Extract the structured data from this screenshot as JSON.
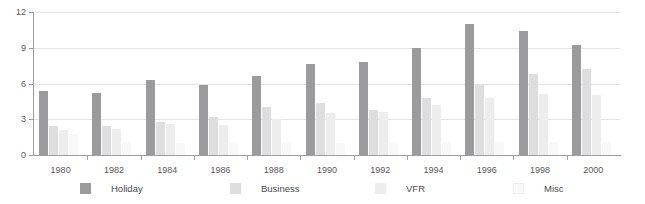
{
  "chart_data": {
    "type": "bar",
    "title": "",
    "xlabel": "",
    "ylabel": "",
    "ylim": [
      0,
      12
    ],
    "yticks": [
      0,
      3,
      6,
      9,
      12
    ],
    "ytick_labels": [
      "0",
      "3",
      "6",
      "9",
      "12"
    ],
    "grid": true,
    "legend_position": "bottom",
    "categories": [
      "1980",
      "1982",
      "1984",
      "1986",
      "1988",
      "1990",
      "1992",
      "1994",
      "1996",
      "1998",
      "2000"
    ],
    "series": [
      {
        "name": "Holiday",
        "color": "#9b9b9d",
        "values": [
          5.4,
          5.2,
          6.3,
          5.9,
          6.6,
          7.6,
          7.8,
          9.0,
          11.0,
          10.4,
          9.2
        ]
      },
      {
        "name": "Business",
        "color": "#dedede",
        "values": [
          2.4,
          2.4,
          2.8,
          3.2,
          4.0,
          4.4,
          3.8,
          4.8,
          5.9,
          6.8,
          7.2
        ]
      },
      {
        "name": "VFR",
        "color": "#ededed",
        "values": [
          2.1,
          2.2,
          2.6,
          2.5,
          3.0,
          3.5,
          3.6,
          4.2,
          4.8,
          5.1,
          5.0
        ]
      },
      {
        "name": "Misc",
        "color": "#f8f8f8",
        "values": [
          1.8,
          1.1,
          1.0,
          1.0,
          1.0,
          1.0,
          1.0,
          1.1,
          1.1,
          1.1,
          1.1
        ]
      }
    ]
  },
  "axis": {
    "y_labels": [
      "12",
      "9",
      "6",
      "3",
      "0"
    ],
    "x_labels": [
      "1980",
      "1982",
      "1984",
      "1986",
      "1988",
      "1990",
      "1992",
      "1994",
      "1996",
      "1998",
      "2000"
    ]
  },
  "legend": {
    "items": [
      {
        "label": "Holiday",
        "color": "#9b9b9d"
      },
      {
        "label": "Business",
        "color": "#dedede"
      },
      {
        "label": "VFR",
        "color": "#ededed"
      },
      {
        "label": "Misc",
        "color": "#f8f8f8"
      }
    ]
  },
  "colors": {
    "axis": "#9d9d9f",
    "grid": "#e3e3e3",
    "text": "#58585a",
    "background": "#ffffff"
  }
}
